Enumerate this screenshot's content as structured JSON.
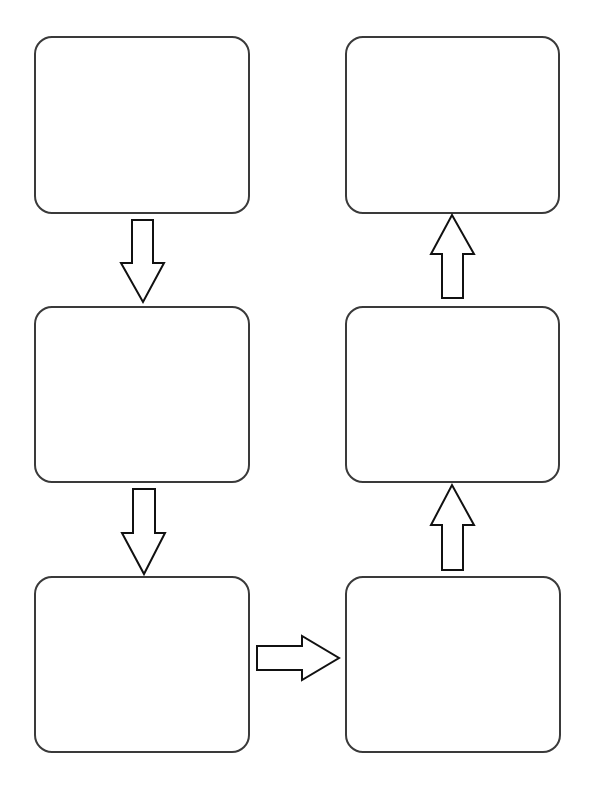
{
  "diagram": {
    "type": "flowchart",
    "style": {
      "box_border_color": "#3a3a3a",
      "arrow_stroke_color": "#111111",
      "background": "#ffffff"
    },
    "boxes": [
      {
        "id": "step-1",
        "label": ""
      },
      {
        "id": "step-2",
        "label": ""
      },
      {
        "id": "step-3",
        "label": ""
      },
      {
        "id": "step-4",
        "label": ""
      },
      {
        "id": "step-5",
        "label": ""
      },
      {
        "id": "step-6",
        "label": ""
      }
    ],
    "arrows": [
      {
        "from": "step-1",
        "to": "step-2",
        "direction": "down"
      },
      {
        "from": "step-2",
        "to": "step-3",
        "direction": "down"
      },
      {
        "from": "step-3",
        "to": "step-4",
        "direction": "right"
      },
      {
        "from": "step-4",
        "to": "step-5",
        "direction": "up"
      },
      {
        "from": "step-5",
        "to": "step-6",
        "direction": "up"
      }
    ]
  }
}
